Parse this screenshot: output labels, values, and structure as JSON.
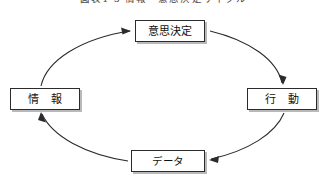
{
  "figure": {
    "caption": "図表1-5 情報・意思決定サイクル",
    "caption_visible_note": "clipped at top edge",
    "background_color": "#ffffff",
    "line_color": "#2b2b2b",
    "shadow_color": "#b9b9b9"
  },
  "diagram": {
    "type": "cycle",
    "direction": "clockwise",
    "ellipse": {
      "center_x": 163,
      "center_y": 96,
      "radius_x": 125,
      "radius_y": 65
    },
    "nodes": [
      {
        "id": "decision",
        "label": "意思決定",
        "position": "top"
      },
      {
        "id": "information",
        "label": "情 報",
        "position": "left"
      },
      {
        "id": "action",
        "label": "行 動",
        "position": "right"
      },
      {
        "id": "data",
        "label": "データ",
        "position": "bottom"
      }
    ],
    "edges": [
      {
        "from": "information",
        "to": "decision",
        "arrowhead": true,
        "side": "upper-left"
      },
      {
        "from": "decision",
        "to": "action",
        "arrowhead": true,
        "side": "upper-right"
      },
      {
        "from": "action",
        "to": "data",
        "arrowhead": true,
        "side": "lower-right"
      },
      {
        "from": "data",
        "to": "information",
        "arrowhead": true,
        "side": "lower-left"
      }
    ]
  }
}
